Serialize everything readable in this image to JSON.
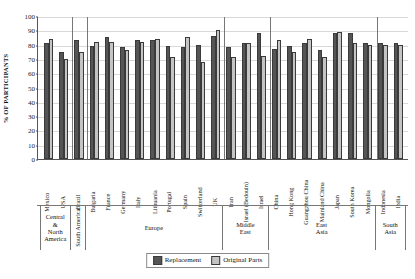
{
  "chart_data": {
    "type": "bar",
    "title": "",
    "xlabel": "",
    "ylabel": "% OF PARTICIPANTS",
    "ylim": [
      0,
      100
    ],
    "yticks": [
      0,
      10,
      20,
      30,
      40,
      50,
      60,
      70,
      80,
      90,
      100
    ],
    "grid": true,
    "legend_position": "bottom-center",
    "categories": [
      "Mexico",
      "USA",
      "Brazil",
      "Bulgaria",
      "France",
      "Germany",
      "Italy",
      "Lithuania",
      "Portugal",
      "Spain",
      "Switzerland",
      "UK",
      "Iran",
      "Israel (Bedouin)",
      "Israel",
      "China",
      "Hong Kong",
      "Guangzhou China",
      "Mainland China",
      "Japan",
      "South Korea",
      "Mongolia",
      "Indonesia",
      "India"
    ],
    "series": [
      {
        "name": "Replacement",
        "color": "#555555",
        "values": [
          81,
          75,
          83,
          79,
          85,
          78,
          83,
          83,
          79,
          78,
          80,
          86,
          78,
          81,
          88,
          77,
          79,
          81,
          76,
          88,
          88,
          81,
          81,
          81
        ]
      },
      {
        "name": "Original Parts",
        "color": "#c4c4c4",
        "values": [
          84,
          70,
          75,
          82,
          82,
          76,
          82,
          84,
          71,
          85,
          68,
          90,
          71,
          81,
          72,
          83,
          75,
          84,
          71,
          89,
          81,
          80,
          80,
          80
        ]
      }
    ],
    "groups": [
      {
        "label": "Central & North America",
        "orientation": "horizontal",
        "count": 2
      },
      {
        "label": "South America",
        "orientation": "vertical",
        "count": 1
      },
      {
        "label": "Europe",
        "orientation": "horizontal",
        "count": 9
      },
      {
        "label": "Middle East",
        "orientation": "horizontal",
        "count": 3
      },
      {
        "label": "East Asia",
        "orientation": "horizontal",
        "count": 7
      },
      {
        "label": "South Asia",
        "orientation": "horizontal",
        "count": 2
      }
    ]
  },
  "legend": {
    "items": [
      {
        "label": "Replacement",
        "swatch": "#555555"
      },
      {
        "label": "Original Parts",
        "swatch": "#c4c4c4"
      }
    ]
  }
}
